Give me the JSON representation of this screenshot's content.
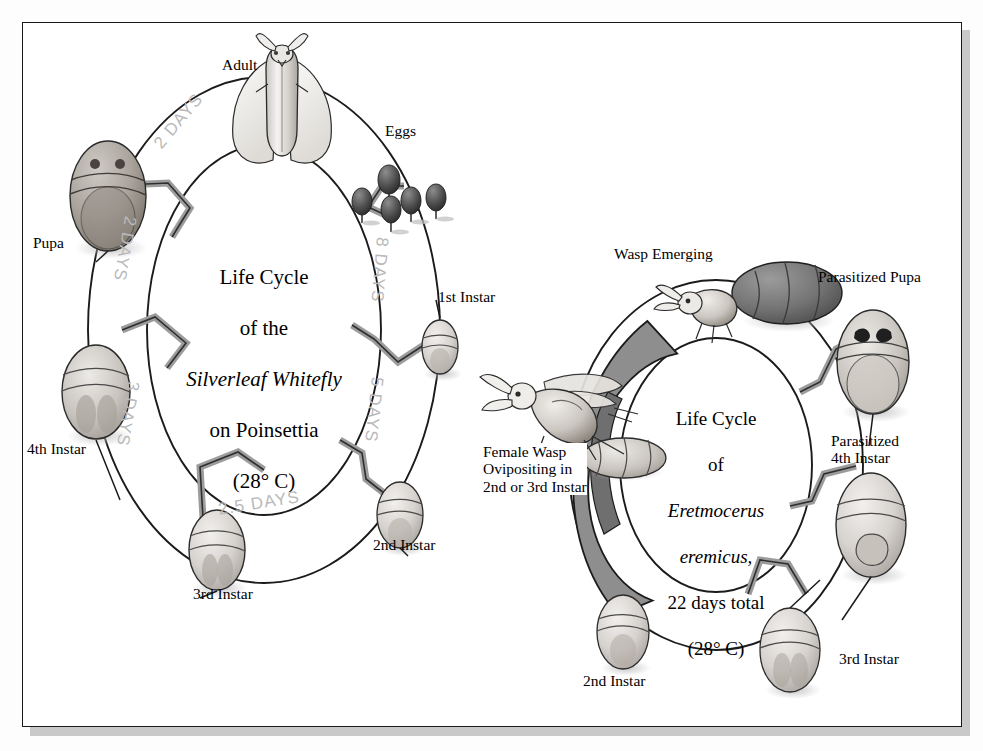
{
  "figure": {
    "background_color": "#ffffff",
    "frame_color": "#1a1a1a",
    "arrow_gray": "#9c9c9c",
    "band_gray": "#8e8e8e",
    "days_label_color": "#b9b9b9"
  },
  "whitefly": {
    "center_text": "Life Cycle\nof the\nSilverleaf Whitefly\non Poinsettia\n(28° C)",
    "center_lines": [
      {
        "text": "Life Cycle",
        "style": "roman"
      },
      {
        "text": "of the",
        "style": "roman"
      },
      {
        "text": "Silverleaf Whitefly",
        "style": "italic-first-letter"
      },
      {
        "text": "on Poinsettia",
        "style": "roman"
      },
      {
        "text": "(28° C)",
        "style": "roman"
      }
    ],
    "stages": [
      {
        "id": "adult",
        "label": "Adult",
        "icon": "adult-whitefly-icon"
      },
      {
        "id": "eggs",
        "label": "Eggs",
        "icon": "whitefly-eggs-icon",
        "count": 5
      },
      {
        "id": "instar1",
        "label": "1st Instar",
        "icon": "nymph-icon"
      },
      {
        "id": "instar2",
        "label": "2nd Instar",
        "icon": "nymph-icon"
      },
      {
        "id": "instar3",
        "label": "3rd Instar",
        "icon": "nymph-icon"
      },
      {
        "id": "instar4",
        "label": "4th Instar",
        "icon": "nymph-icon"
      },
      {
        "id": "pupa",
        "label": "Pupa",
        "icon": "pupa-icon"
      }
    ],
    "durations": [
      {
        "id": "eggs-to-1st",
        "label": "8 DAYS",
        "days": 8,
        "from": "eggs",
        "to": "1st Instar"
      },
      {
        "id": "1st-to-2nd",
        "label": "5 DAYS",
        "days": 5,
        "from": "1st Instar",
        "to": "2nd Instar"
      },
      {
        "id": "2nd-to-3rd",
        "label": "2.5 DAYS",
        "days": 2.5,
        "from": "2nd Instar",
        "to": "3rd Instar"
      },
      {
        "id": "3rd-to-4th",
        "label": "3 DAYS",
        "days": 3,
        "from": "3rd Instar",
        "to": "4th Instar"
      },
      {
        "id": "4th-to-pupa",
        "label": "2 DAYS",
        "days": 2,
        "from": "4th Instar",
        "to": "Pupa"
      },
      {
        "id": "pupa-to-adult",
        "label": "2 DAYS",
        "days": 2,
        "from": "Pupa",
        "to": "Adult"
      }
    ]
  },
  "parasitoid": {
    "center_text": "Life Cycle\nof\nEretmocerus\neremicus,\n22 days total\n(28° C)",
    "center_lines": [
      {
        "text": "Life Cycle",
        "style": "roman"
      },
      {
        "text": "of",
        "style": "roman"
      },
      {
        "text": "Eretmocerus",
        "style": "italic"
      },
      {
        "text": "eremicus,",
        "style": "italic"
      },
      {
        "text": "22 days total",
        "style": "roman"
      },
      {
        "text": "(28° C)",
        "style": "roman"
      }
    ],
    "total_days": 22,
    "temperature": "28° C",
    "stages": [
      {
        "id": "wasp-emerging",
        "label": "Wasp Emerging",
        "icon": "wasp-emerging-icon"
      },
      {
        "id": "parasitized-pupa",
        "label": "Parasitized Pupa",
        "icon": "parasitized-pupa-icon"
      },
      {
        "id": "parasitized-4th",
        "label": "Parasitized\n4th Instar",
        "icon": "parasitized-nymph-icon"
      },
      {
        "id": "p-instar3",
        "label": "3rd Instar",
        "icon": "nymph-icon"
      },
      {
        "id": "p-instar2",
        "label": "2nd Instar",
        "icon": "nymph-icon"
      },
      {
        "id": "female-wasp",
        "label": "Female Wasp\nOvipositing in\n2nd or 3rd Instar",
        "icon": "female-wasp-icon"
      }
    ]
  }
}
